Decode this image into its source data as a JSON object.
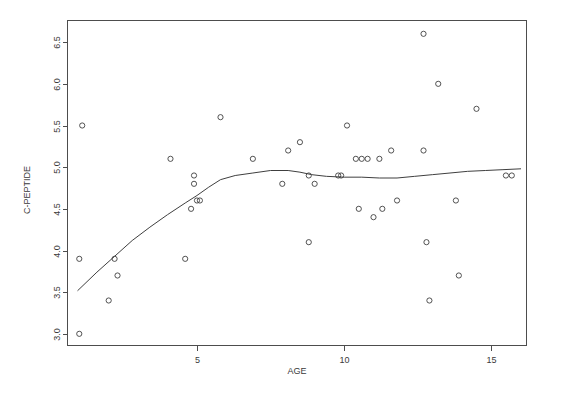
{
  "chart_data": {
    "type": "scatter",
    "title": "",
    "subtitle": "",
    "xlabel": "AGE",
    "ylabel": "C-PEPTIDE",
    "xlim": [
      0.6,
      16.2
    ],
    "ylim": [
      2.86,
      6.76
    ],
    "xticks": [
      5,
      10,
      15
    ],
    "xtick_labels": [
      "5",
      "10",
      "15"
    ],
    "yticks": [
      3.0,
      3.5,
      4.0,
      4.5,
      5.0,
      5.5,
      6.0,
      6.5
    ],
    "ytick_labels": [
      "3.0",
      "3.5",
      "4.0",
      "4.5",
      "5.0",
      "5.5",
      "6.0",
      "6.5"
    ],
    "grid": false,
    "legend": false,
    "legend_position": "none",
    "box": true,
    "point_marker": "open-circle",
    "point_color": "#3f3f3f",
    "line_color": "#3f3f3f",
    "axis_color": "#4d4d4d",
    "background": "#ffffff",
    "series": [
      {
        "name": "observations",
        "type": "scatter",
        "points": [
          [
            1.0,
            3.0
          ],
          [
            1.0,
            3.9
          ],
          [
            1.1,
            5.5
          ],
          [
            2.0,
            3.4
          ],
          [
            2.2,
            3.9
          ],
          [
            2.3,
            3.7
          ],
          [
            4.1,
            5.1
          ],
          [
            4.6,
            3.9
          ],
          [
            4.8,
            4.5
          ],
          [
            4.9,
            4.9
          ],
          [
            4.9,
            4.8
          ],
          [
            5.0,
            4.6
          ],
          [
            5.1,
            4.6
          ],
          [
            5.8,
            5.6
          ],
          [
            6.9,
            5.1
          ],
          [
            7.9,
            4.8
          ],
          [
            8.1,
            5.2
          ],
          [
            8.5,
            5.3
          ],
          [
            8.8,
            4.9
          ],
          [
            8.8,
            4.1
          ],
          [
            9.0,
            4.8
          ],
          [
            9.8,
            4.9
          ],
          [
            9.9,
            4.9
          ],
          [
            10.1,
            5.5
          ],
          [
            10.4,
            5.1
          ],
          [
            10.5,
            4.5
          ],
          [
            10.6,
            5.1
          ],
          [
            10.8,
            5.1
          ],
          [
            11.0,
            4.4
          ],
          [
            11.2,
            5.1
          ],
          [
            11.3,
            4.5
          ],
          [
            11.6,
            5.2
          ],
          [
            11.8,
            4.6
          ],
          [
            12.7,
            6.6
          ],
          [
            12.7,
            5.2
          ],
          [
            12.8,
            4.1
          ],
          [
            12.9,
            3.4
          ],
          [
            13.2,
            6.0
          ],
          [
            13.8,
            4.6
          ],
          [
            13.9,
            3.7
          ],
          [
            14.5,
            5.7
          ],
          [
            15.5,
            4.9
          ],
          [
            15.7,
            4.9
          ]
        ]
      },
      {
        "name": "loess-smooth",
        "type": "line",
        "points": [
          [
            0.95,
            3.52
          ],
          [
            1.6,
            3.74
          ],
          [
            2.2,
            3.93
          ],
          [
            2.8,
            4.12
          ],
          [
            3.4,
            4.28
          ],
          [
            4.0,
            4.43
          ],
          [
            4.6,
            4.57
          ],
          [
            5.0,
            4.66
          ],
          [
            5.4,
            4.76
          ],
          [
            5.8,
            4.85
          ],
          [
            6.3,
            4.9
          ],
          [
            6.9,
            4.93
          ],
          [
            7.5,
            4.96
          ],
          [
            8.1,
            4.96
          ],
          [
            8.5,
            4.94
          ],
          [
            8.9,
            4.91
          ],
          [
            9.4,
            4.89
          ],
          [
            10.0,
            4.88
          ],
          [
            10.6,
            4.88
          ],
          [
            11.2,
            4.87
          ],
          [
            11.8,
            4.87
          ],
          [
            12.4,
            4.89
          ],
          [
            13.0,
            4.91
          ],
          [
            13.6,
            4.93
          ],
          [
            14.2,
            4.95
          ],
          [
            14.8,
            4.96
          ],
          [
            15.4,
            4.97
          ],
          [
            16.0,
            4.98
          ]
        ]
      }
    ]
  },
  "axes": {
    "x_title": "AGE",
    "y_title": "C-PEPTIDE"
  }
}
